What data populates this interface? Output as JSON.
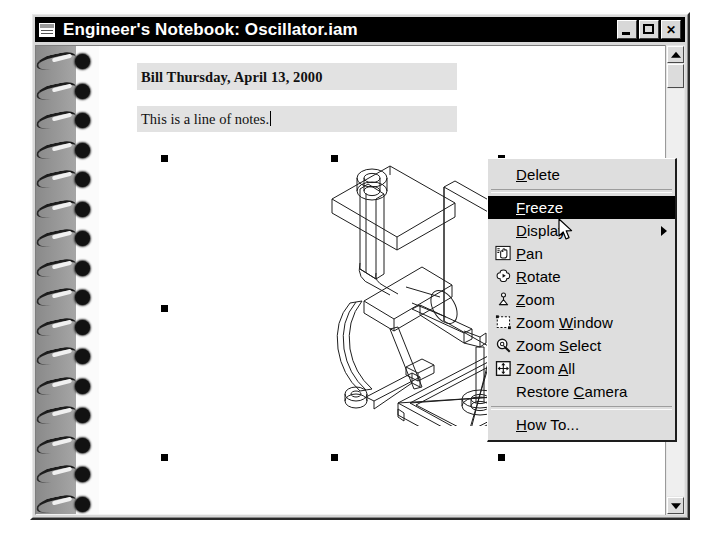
{
  "window": {
    "title": "Engineer's Notebook: Oscillator.iam",
    "icon": "notebook-window-icon",
    "buttons": {
      "minimize": "_",
      "maximize": "□",
      "close": "✕"
    }
  },
  "note": {
    "date_line": "Bill Thursday, April 13, 2000",
    "body_line": "This is a line of notes.",
    "caret_visible": true
  },
  "embedded_object": {
    "name": "oscillator-wireframe-drawing",
    "selected": true,
    "handle_count": 8
  },
  "scrollbar": {
    "up_arrow": "▲",
    "down_arrow": "▼",
    "orientation": "vertical"
  },
  "context_menu": {
    "items": [
      {
        "label": "Delete",
        "mnemonic": "D",
        "icon": null,
        "type": "item",
        "selected": false,
        "submenu": false
      },
      {
        "label": "",
        "mnemonic": "",
        "icon": null,
        "type": "separator",
        "selected": false,
        "submenu": false
      },
      {
        "label": "Freeze",
        "mnemonic": "F",
        "icon": null,
        "type": "item",
        "selected": true,
        "submenu": false
      },
      {
        "label": "Display",
        "mnemonic": "D",
        "icon": null,
        "type": "item",
        "selected": false,
        "submenu": true
      },
      {
        "label": "Pan",
        "mnemonic": "P",
        "icon": "pan-hand-icon",
        "type": "item",
        "selected": false,
        "submenu": false
      },
      {
        "label": "Rotate",
        "mnemonic": "R",
        "icon": "rotate-icon",
        "type": "item",
        "selected": false,
        "submenu": false
      },
      {
        "label": "Zoom",
        "mnemonic": "Z",
        "icon": "zoom-icon",
        "type": "item",
        "selected": false,
        "submenu": false
      },
      {
        "label": "Zoom Window",
        "mnemonic": "W",
        "icon": "zoom-window-icon",
        "type": "item",
        "selected": false,
        "submenu": false
      },
      {
        "label": "Zoom Select",
        "mnemonic": "S",
        "icon": "zoom-select-icon",
        "type": "item",
        "selected": false,
        "submenu": false
      },
      {
        "label": "Zoom All",
        "mnemonic": "A",
        "icon": "zoom-all-icon",
        "type": "item",
        "selected": false,
        "submenu": false
      },
      {
        "label": "Restore Camera",
        "mnemonic": "C",
        "icon": null,
        "type": "item",
        "selected": false,
        "submenu": false
      },
      {
        "label": "",
        "mnemonic": "",
        "icon": null,
        "type": "separator",
        "selected": false,
        "submenu": false
      },
      {
        "label": "How To...",
        "mnemonic": "H",
        "icon": null,
        "type": "item",
        "selected": false,
        "submenu": false
      }
    ]
  },
  "colors": {
    "titlebar_bg": "#000000",
    "titlebar_text": "#ffffff",
    "window_face": "#d8d8d8",
    "menu_face": "#dedede",
    "menu_highlight": "#000000",
    "note_field_bg": "#e2e2e2",
    "page_bg": "#ffffff",
    "binding_bg": "#8d8d8d"
  }
}
